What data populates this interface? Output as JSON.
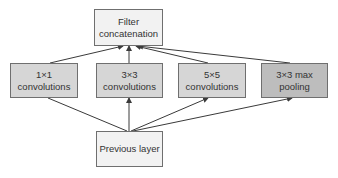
{
  "diagram": {
    "top": {
      "label_line1": "Filter",
      "label_line2": "concatenation",
      "fill": "#f2f2f2"
    },
    "branches": [
      {
        "label": "1×1 convolutions",
        "fill": "#d6d6d6"
      },
      {
        "label": "3×3 convolutions",
        "fill": "#d6d6d6"
      },
      {
        "label": "5×5 convolutions",
        "fill": "#d6d6d6"
      },
      {
        "label": "3×3 max pooling",
        "fill": "#bdbdbd"
      }
    ],
    "bottom": {
      "label": "Previous layer",
      "fill": "#f2f2f2"
    },
    "edge_color": "#3a3a3a"
  }
}
